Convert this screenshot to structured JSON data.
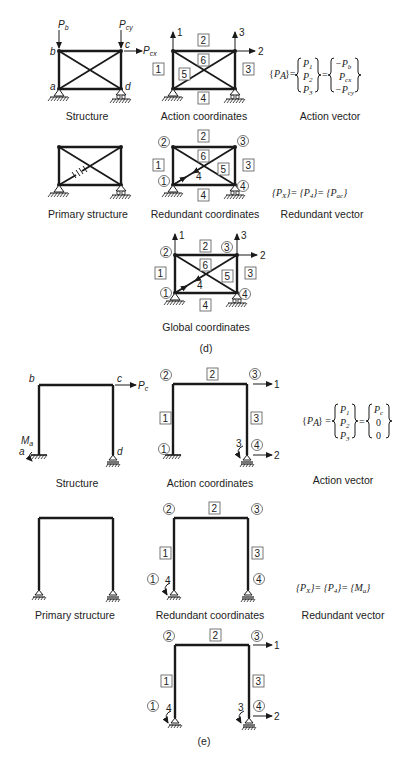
{
  "figure_d": {
    "label": "(d)",
    "structure": {
      "caption": "Structure",
      "joints": [
        "a",
        "b",
        "c",
        "d"
      ],
      "loads": [
        "P_b",
        "P_cy",
        "P_cx"
      ]
    },
    "action_coordinates": {
      "caption": "Action coordinates",
      "coordinates": [
        "1",
        "2",
        "3"
      ],
      "members": [
        "1",
        "2",
        "3",
        "4",
        "5",
        "6"
      ]
    },
    "action_vector": {
      "caption": "Action vector",
      "lhs": "{P_A}",
      "entries": [
        "P_1",
        "P_2",
        "P_3"
      ],
      "values": [
        "-P_b",
        "P_cx",
        "-P_cy"
      ]
    },
    "primary_structure": {
      "caption": "Primary structure"
    },
    "redundant_coordinates": {
      "caption": "Redundant coordinates",
      "joints": [
        "1",
        "2",
        "3",
        "4"
      ],
      "members": [
        "1",
        "2",
        "3",
        "4",
        "5",
        "6"
      ],
      "coordinate": "4"
    },
    "redundant_vector": {
      "caption": "Redundant vector",
      "expression": "{P_X} = {P_4} = {P_ac}"
    },
    "global_coordinates": {
      "caption": "Global coordinates",
      "coordinates": [
        "1",
        "2",
        "3",
        "4"
      ],
      "joints": [
        "1",
        "2",
        "3",
        "4"
      ],
      "members": [
        "1",
        "2",
        "3",
        "4",
        "5",
        "6"
      ]
    }
  },
  "figure_e": {
    "label": "(e)",
    "structure": {
      "caption": "Structure",
      "joints": [
        "a",
        "b",
        "c",
        "d"
      ],
      "loads": [
        "P_c",
        "M_a"
      ]
    },
    "action_coordinates": {
      "caption": "Action coordinates",
      "coordinates": [
        "1",
        "2",
        "3"
      ],
      "joints": [
        "1",
        "2",
        "3",
        "4"
      ],
      "members": [
        "1",
        "2",
        "3"
      ]
    },
    "action_vector": {
      "caption": "Action vector",
      "lhs": "{P_A}",
      "entries": [
        "P_1",
        "P_2",
        "P_3"
      ],
      "values": [
        "P_c",
        "0",
        "0"
      ]
    },
    "primary_structure": {
      "caption": "Primary structure"
    },
    "redundant_coordinates": {
      "caption": "Redundant coordinates",
      "joints": [
        "1",
        "2",
        "3",
        "4"
      ],
      "members": [
        "1",
        "2",
        "3"
      ],
      "coordinate": "4"
    },
    "redundant_vector": {
      "caption": "Redundant vector",
      "expression": "{P_X} = {P_4} = {M_a}"
    },
    "global_coordinates": {
      "coordinates": [
        "1",
        "2",
        "3",
        "4"
      ],
      "joints": [
        "1",
        "2",
        "3",
        "4"
      ],
      "members": [
        "1",
        "2",
        "3"
      ]
    }
  }
}
